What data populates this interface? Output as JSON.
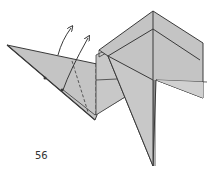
{
  "diagram": {
    "type": "origami-folding-step",
    "step_number": "56",
    "colors": {
      "paper_fill": "#c4c4c4",
      "paper_fill_light": "#cfcfcf",
      "edge": "#3a3a3a",
      "background": "#ffffff"
    },
    "annotations": [
      {
        "kind": "arrow",
        "description": "fold-up arrow from left flap edge"
      },
      {
        "kind": "arrow",
        "description": "fold-up arrow along valley line"
      },
      {
        "kind": "dashed-line",
        "description": "valley fold line on left flap"
      },
      {
        "kind": "dashed-line",
        "description": "vertical fold line at body junction"
      }
    ]
  }
}
